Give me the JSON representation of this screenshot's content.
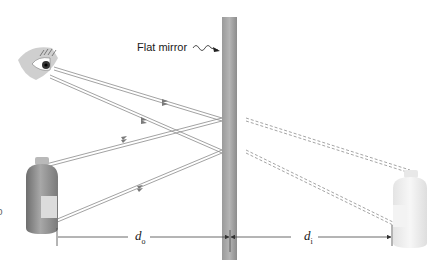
{
  "figure": {
    "mirror_label": "Flat mirror",
    "object_distance": {
      "symbol": "d",
      "subscript": "o"
    },
    "image_distance": {
      "symbol": "d",
      "subscript": "i"
    },
    "edge_fragment": "o"
  },
  "elements": {
    "eye": {
      "name": "eye",
      "position": "upper-left"
    },
    "object": {
      "name": "bottle",
      "role": "object",
      "style": "solid"
    },
    "image": {
      "name": "bottle",
      "role": "virtual image",
      "style": "faded"
    },
    "mirror": {
      "name": "flat mirror",
      "orientation": "vertical"
    },
    "rays": {
      "real": "solid lines with arrows",
      "virtual": "dashed extensions behind mirror"
    }
  },
  "colors": {
    "mirror_dark": "#8f8f8f",
    "mirror_light": "#b8b8b8",
    "ray": "#8a8a8a",
    "bottle_body": "#9a9a9a",
    "bottle_label": "#dcdcdc",
    "image_bottle": "#ececec",
    "text": "#1a1a1a"
  }
}
